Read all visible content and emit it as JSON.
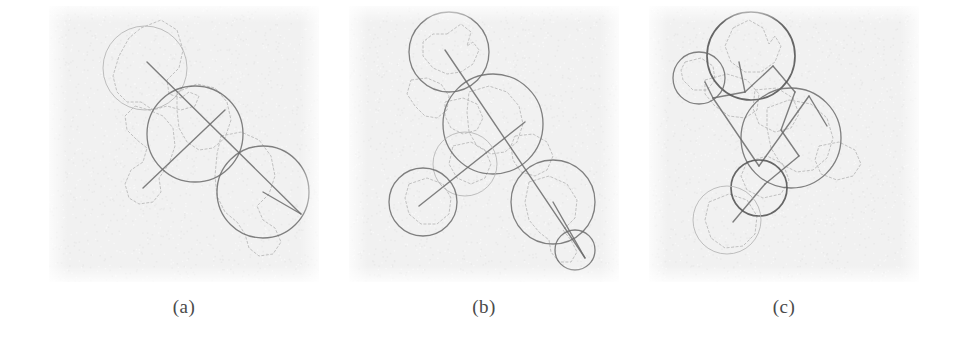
{
  "figure": {
    "background_color": "#ffffff",
    "panel_background_color": "#f1f1f1",
    "ink_dark": "#6b6b6b",
    "ink_mid": "#8f8f8f",
    "ink_light": "#b4b4b4",
    "caption_color": "#4a4a4a"
  },
  "panels": [
    {
      "id": "a",
      "caption": "(a)",
      "contours": [
        "M 92,22 L 112,14 L 128,24 L 134,44 L 130,62 L 118,74 L 120,88 L 132,92 L 140,86 L 150,90 L 146,100 L 132,104 L 118,100 L 104,104 L 92,96 L 78,96 L 68,86 L 64,70 L 70,50 L 80,32 Z",
        "M 86,100 L 100,104 L 114,110 L 124,122 L 126,140 L 120,158 L 110,172 L 112,186 L 104,196 L 90,198 L 80,192 L 76,178 L 82,164 L 94,156 L 98,142 L 88,134 L 78,124 L 76,110 Z",
        "M 128,86 L 148,78 L 166,82 L 178,96 L 182,114 L 176,132 L 164,142 L 150,144 L 138,136 L 130,122 L 128,104 Z",
        "M 172,130 L 192,126 L 210,134 L 222,150 L 226,170 L 220,188 L 208,200 L 214,214 L 226,222 L 232,236 L 224,248 L 210,250 L 200,242 L 196,228 L 188,216 L 176,206 L 168,190 L 166,170 L 168,148 Z"
      ],
      "circles": [
        {
          "cx": 96,
          "cy": 62,
          "r": 42,
          "weight": "light"
        },
        {
          "cx": 146,
          "cy": 128,
          "r": 48,
          "weight": "dark"
        },
        {
          "cx": 214,
          "cy": 186,
          "r": 46,
          "weight": "dark"
        }
      ],
      "axis_lines": [
        {
          "x1": 98,
          "y1": 56,
          "x2": 252,
          "y2": 208
        },
        {
          "x1": 176,
          "y1": 104,
          "x2": 94,
          "y2": 182
        },
        {
          "x1": 214,
          "y1": 186,
          "x2": 252,
          "y2": 208
        }
      ]
    },
    {
      "id": "b",
      "caption": "(b)",
      "contours": [
        "M 98,28 L 112,18 L 122,26 L 118,40 L 124,36 L 130,44 L 124,58 L 112,66 L 98,68 L 84,62 L 74,50 L 74,36 L 84,28 Z",
        "M 62,74 L 78,72 L 92,78 L 100,90 L 98,104 L 88,112 L 76,110 L 66,100 L 58,88 Z",
        "M 96,96 L 114,92 L 128,98 L 134,112 L 128,124 L 114,128 L 102,122 L 96,110 Z",
        "M 120,86 L 140,80 L 158,86 L 170,100 L 174,118 L 168,136 L 156,146 L 142,148 L 128,140 L 120,126 L 118,106 Z",
        "M 166,130 L 184,128 L 198,136 L 204,150 L 198,164 L 186,170 L 172,166 L 164,154 L 162,140 Z",
        "M 104,140 L 122,136 L 136,144 L 142,158 L 136,172 L 122,178 L 108,172 L 100,158 Z",
        "M 60,178 L 78,172 L 94,178 L 102,192 L 100,208 L 88,218 L 72,218 L 60,208 L 56,192 Z",
        "M 180,176 L 200,170 L 218,178 L 228,194 L 226,212 L 214,224 L 222,234 L 228,246 L 222,256 L 210,256 L 202,246 L 200,234 L 190,226 L 180,214 L 176,196 Z"
      ],
      "circles": [
        {
          "cx": 100,
          "cy": 46,
          "r": 40,
          "weight": "dark"
        },
        {
          "cx": 144,
          "cy": 118,
          "r": 50,
          "weight": "dark"
        },
        {
          "cx": 116,
          "cy": 158,
          "r": 32,
          "weight": "light"
        },
        {
          "cx": 74,
          "cy": 196,
          "r": 34,
          "weight": "dark"
        },
        {
          "cx": 204,
          "cy": 196,
          "r": 42,
          "weight": "dark"
        },
        {
          "cx": 226,
          "cy": 244,
          "r": 20,
          "weight": "dark"
        }
      ],
      "axis_lines": [
        {
          "x1": 96,
          "y1": 44,
          "x2": 236,
          "y2": 252
        },
        {
          "x1": 70,
          "y1": 200,
          "x2": 176,
          "y2": 116
        },
        {
          "x1": 204,
          "y1": 196,
          "x2": 236,
          "y2": 252
        }
      ]
    },
    {
      "id": "c",
      "caption": "(c)",
      "contours": [
        "M 84,22 L 100,14 L 114,22 L 120,38 L 126,30 L 132,40 L 126,56 L 112,66 L 96,66 L 82,56 L 76,40 Z",
        "M 36,56 L 52,52 L 64,60 L 66,74 L 58,84 L 44,84 L 34,74 L 32,64 Z",
        "M 56,74 L 78,68 L 98,74 L 110,88 L 108,104 L 96,112 L 80,110 L 66,100 L 56,88 Z",
        "M 106,84 L 128,82 L 144,92 L 150,108 L 142,122 L 126,126 L 110,118 L 104,102 Z",
        "M 118,102 L 140,94 L 162,98 L 178,112 L 184,132 L 178,152 L 164,164 L 148,166 L 132,158 L 122,142 L 118,122 Z",
        "M 170,140 L 190,136 L 206,144 L 212,158 L 204,170 L 188,174 L 172,168 L 166,154 Z",
        "M 98,156 L 118,150 L 134,158 L 140,174 L 132,188 L 114,192 L 98,184 L 92,170 Z",
        "M 60,196 L 80,188 L 98,194 L 108,210 L 106,228 L 94,240 L 76,242 L 62,232 L 56,214 Z"
      ],
      "circles": [
        {
          "cx": 102,
          "cy": 50,
          "r": 44,
          "weight": "darker"
        },
        {
          "cx": 50,
          "cy": 72,
          "r": 26,
          "weight": "dark"
        },
        {
          "cx": 142,
          "cy": 132,
          "r": 50,
          "weight": "dark"
        },
        {
          "cx": 110,
          "cy": 182,
          "r": 28,
          "weight": "darker"
        },
        {
          "cx": 78,
          "cy": 214,
          "r": 34,
          "weight": "light"
        }
      ],
      "axis_lines": [
        {
          "x1": 90,
          "y1": 56,
          "x2": 96,
          "y2": 86
        },
        {
          "x1": 96,
          "y1": 86,
          "x2": 64,
          "y2": 92
        },
        {
          "x1": 64,
          "y1": 92,
          "x2": 56,
          "y2": 76
        },
        {
          "x1": 96,
          "y1": 86,
          "x2": 124,
          "y2": 60
        },
        {
          "x1": 124,
          "y1": 60,
          "x2": 146,
          "y2": 86
        },
        {
          "x1": 146,
          "y1": 86,
          "x2": 132,
          "y2": 124
        },
        {
          "x1": 132,
          "y1": 124,
          "x2": 150,
          "y2": 150
        },
        {
          "x1": 150,
          "y1": 150,
          "x2": 116,
          "y2": 178
        },
        {
          "x1": 116,
          "y1": 178,
          "x2": 84,
          "y2": 216
        },
        {
          "x1": 64,
          "y1": 92,
          "x2": 110,
          "y2": 160
        },
        {
          "x1": 110,
          "y1": 160,
          "x2": 160,
          "y2": 90
        },
        {
          "x1": 160,
          "y1": 90,
          "x2": 178,
          "y2": 120
        }
      ]
    }
  ]
}
